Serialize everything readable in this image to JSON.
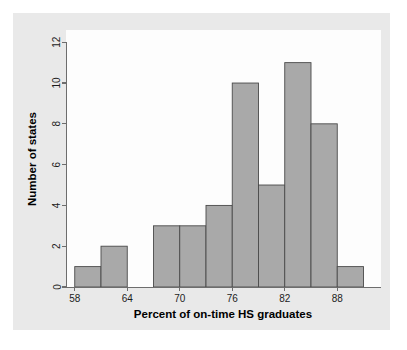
{
  "figure": {
    "background_color": "#ffffff",
    "plate_color": "#e9e9e9",
    "panel_color": "#fdfdfd"
  },
  "chart_data": {
    "type": "bar",
    "subtype": "histogram",
    "title": "",
    "xlabel": "Percent of on-time HS graduates",
    "ylabel": "Number of states",
    "bin_width": 3,
    "bin_edges": [
      58,
      61,
      64,
      67,
      70,
      73,
      76,
      79,
      82,
      85,
      88,
      91
    ],
    "categories": [
      "58-61",
      "61-64",
      "64-67",
      "67-70",
      "70-73",
      "73-76",
      "76-79",
      "79-82",
      "82-85",
      "85-88",
      "88-91"
    ],
    "values": [
      1,
      2,
      0,
      3,
      3,
      4,
      10,
      5,
      11,
      8,
      1
    ],
    "xlim": [
      57,
      93
    ],
    "ylim": [
      0,
      12.6
    ],
    "xticks": [
      58,
      64,
      70,
      76,
      82,
      88
    ],
    "xtick_labels": [
      "58",
      "64",
      "70",
      "76",
      "82",
      "88"
    ],
    "yticks": [
      0,
      2,
      4,
      6,
      8,
      10,
      12
    ],
    "ytick_labels": [
      "0",
      "2",
      "4",
      "6",
      "8",
      "10",
      "12"
    ],
    "grid": false,
    "legend": false,
    "bar_fill_color": "#a9a9a9",
    "bar_edge_color": "#4a4a4a",
    "axis_color": "#6d6d6d"
  }
}
